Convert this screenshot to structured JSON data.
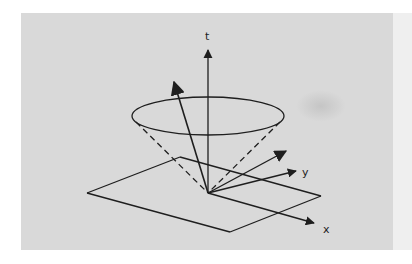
{
  "figure": {
    "colors": {
      "background": "#d9d9d9",
      "stroke": "#1e1e1e"
    },
    "axes": {
      "t": {
        "label": "t"
      },
      "x": {
        "label": "x"
      },
      "y": {
        "label": "y"
      }
    },
    "elements": {
      "cone_top_ellipse": "light cone cross-section",
      "cone_edges": "dashed cone boundaries",
      "plane": "spatial hyperplane",
      "vectors": [
        "timelike vector outside-tilted",
        "spacelike vector",
        "y axis",
        "x axis"
      ]
    }
  }
}
